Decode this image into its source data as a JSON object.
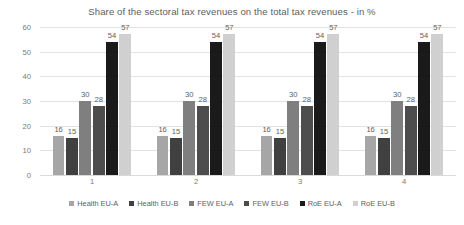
{
  "chart_data": {
    "type": "bar",
    "title": "Share of the sectoral tax revenues on the total tax revenues - in %",
    "xlabel": "",
    "ylabel": "",
    "categories": [
      "1",
      "2",
      "3",
      "4"
    ],
    "series": [
      {
        "name": "Health EU-A",
        "color": "#a6a6a6",
        "values": [
          16,
          16,
          16,
          16
        ]
      },
      {
        "name": "Health EU-B",
        "color": "#404040",
        "values": [
          15,
          15,
          15,
          15
        ]
      },
      {
        "name": "FEW EU-A",
        "color": "#7f7f7f",
        "values": [
          30,
          30,
          30,
          30
        ]
      },
      {
        "name": "FEW EU-B",
        "color": "#4d4d4d",
        "values": [
          28,
          28,
          28,
          28
        ]
      },
      {
        "name": "RoE EU-A",
        "color": "#1a1a1a",
        "values": [
          54,
          54,
          54,
          54
        ]
      },
      {
        "name": "RoE EU-B",
        "color": "#d0d0d0",
        "values": [
          57,
          57,
          57,
          57
        ]
      }
    ],
    "ylim": [
      0,
      60
    ],
    "yticks": [
      0,
      10,
      20,
      30,
      40,
      50,
      60
    ],
    "ytick_labels": [
      "0",
      "10",
      "20",
      "30",
      "40",
      "50",
      "60"
    ],
    "grid": true,
    "legend_position": "bottom",
    "data_labels": true
  }
}
